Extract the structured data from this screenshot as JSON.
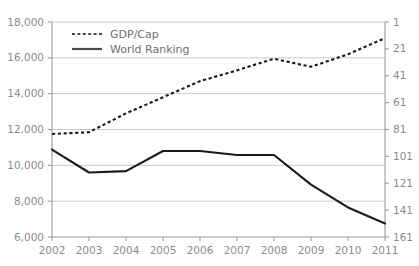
{
  "chart_data": {
    "type": "line",
    "title": "",
    "xlabel": "",
    "ylabel": "",
    "grid": true,
    "legend_position": "top-left",
    "categories": [
      "2002",
      "2003",
      "2004",
      "2005",
      "2006",
      "2007",
      "2008",
      "2009",
      "2010",
      "2011"
    ],
    "axes": {
      "left": {
        "label": "GDP/Cap",
        "ylim": [
          6000,
          18000
        ],
        "ticks": [
          18000,
          16000,
          14000,
          12000,
          10000,
          8000,
          6000
        ],
        "tick_labels": [
          "18,000",
          "16,000",
          "14,000",
          "12,000",
          "10,000",
          "8,000",
          "6,000"
        ],
        "inverted": false
      },
      "right": {
        "label": "World Ranking",
        "ylim": [
          1,
          161
        ],
        "ticks": [
          1,
          21,
          41,
          61,
          81,
          101,
          121,
          141,
          161
        ],
        "tick_labels": [
          "1",
          "21",
          "41",
          "61",
          "81",
          "101",
          "121",
          "141",
          "161"
        ],
        "inverted": true
      }
    },
    "series": [
      {
        "name": "GDP/Cap",
        "axis": "left",
        "style": "dotted",
        "color": "#1a1a1a",
        "values": [
          11750,
          11850,
          12900,
          13800,
          14700,
          15300,
          15950,
          15500,
          16200,
          17100
        ]
      },
      {
        "name": "World Ranking",
        "axis": "right",
        "style": "solid",
        "color": "#1a1a1a",
        "values": [
          96,
          113,
          112,
          97,
          97,
          100,
          100,
          122,
          139,
          151
        ]
      }
    ]
  },
  "legend": {
    "items": [
      {
        "label": "GDP/Cap",
        "style": "dotted"
      },
      {
        "label": "World Ranking",
        "style": "solid"
      }
    ]
  }
}
